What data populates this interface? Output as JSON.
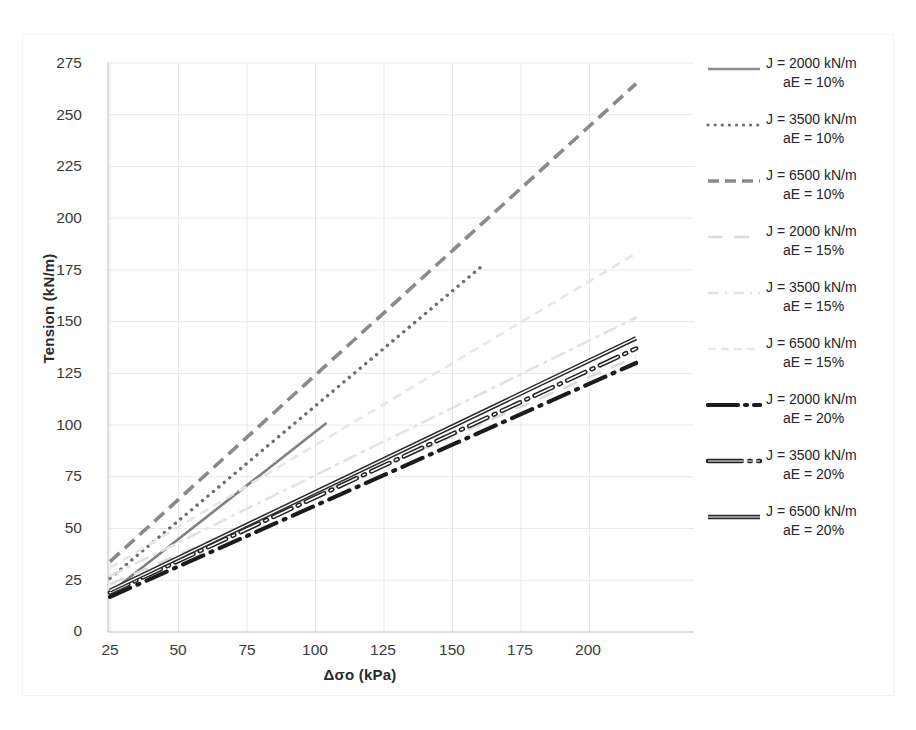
{
  "chart_data": {
    "type": "line",
    "title": "",
    "xlabel": "Δσo (kPa)",
    "ylabel": "Tension (kN/m)",
    "xlim": [
      25,
      218
    ],
    "ylim": [
      0,
      275
    ],
    "xticks": [
      25,
      50,
      75,
      100,
      125,
      150,
      175,
      200
    ],
    "yticks": [
      0,
      25,
      50,
      75,
      100,
      125,
      150,
      175,
      200,
      225,
      250,
      275
    ],
    "grid": true,
    "legend_position": "right",
    "series": [
      {
        "name": "J = 2000 kN/m aE = 10%",
        "J": 2000,
        "aE": "10%",
        "style": "solid",
        "color": "#808080",
        "width": 2.6,
        "x": [
          25,
          104
        ],
        "y": [
          19,
          101
        ]
      },
      {
        "name": "J = 3500 kN/m aE = 10%",
        "J": 3500,
        "aE": "10%",
        "style": "dotted",
        "color": "#6f6f6f",
        "width": 3.4,
        "x": [
          25,
          160
        ],
        "y": [
          26,
          176
        ]
      },
      {
        "name": "J = 6500 kN/m aE = 10%",
        "J": 6500,
        "aE": "10%",
        "style": "dashed",
        "color": "#8a8a8a",
        "width": 3.6,
        "x": [
          25,
          217
        ],
        "y": [
          34,
          265
        ]
      },
      {
        "name": "J = 2000 kN/m aE = 15%",
        "J": 2000,
        "aE": "15%",
        "style": "long-dash",
        "color": "#dcdcdc",
        "width": 2.6,
        "x": [
          25,
          217
        ],
        "y": [
          23,
          133
        ]
      },
      {
        "name": "J = 3500 kN/m aE = 15%",
        "J": 3500,
        "aE": "15%",
        "style": "dash-dot",
        "color": "#e2e2e2",
        "width": 2.6,
        "x": [
          25,
          217
        ],
        "y": [
          27,
          152
        ]
      },
      {
        "name": "J = 6500 kN/m aE = 15%",
        "J": 6500,
        "aE": "15%",
        "style": "fine-dash",
        "color": "#e6e6e6",
        "width": 2.6,
        "x": [
          25,
          217
        ],
        "y": [
          31,
          183
        ]
      },
      {
        "name": "J = 2000 kN/m aE = 20%",
        "J": 2000,
        "aE": "20%",
        "style": "dash-dot-heavy",
        "color": "#1c1c1c",
        "width": 4.2,
        "x": [
          25,
          217
        ],
        "y": [
          17,
          130
        ]
      },
      {
        "name": "J = 3500 kN/m aE = 20%",
        "J": 3500,
        "aE": "20%",
        "style": "double-dot",
        "color": "#232323",
        "width": 3.2,
        "x": [
          25,
          217
        ],
        "y": [
          19,
          137
        ]
      },
      {
        "name": "J = 6500 kN/m aE = 20%",
        "J": 6500,
        "aE": "20%",
        "style": "double-solid",
        "color": "#2a2a2a",
        "width": 3.0,
        "x": [
          25,
          217
        ],
        "y": [
          20,
          142
        ]
      }
    ]
  },
  "axes": {
    "y_title": "Tension (kN/m)",
    "x_title": "Δσo (kPa)",
    "y_ticks": [
      "275",
      "250",
      "225",
      "200",
      "175",
      "150",
      "125",
      "100",
      "75",
      "50",
      "25",
      "0"
    ],
    "x_ticks": [
      "25",
      "50",
      "75",
      "100",
      "125",
      "150",
      "175",
      "200"
    ]
  },
  "legend": {
    "items": [
      {
        "line1": "J = 2000 kN/m",
        "line2": "aE = 10%",
        "swatch": "solid-gray"
      },
      {
        "line1": "J = 3500 kN/m",
        "line2": "aE = 10%",
        "swatch": "dotted-gray"
      },
      {
        "line1": "J = 6500 kN/m",
        "line2": "aE = 10%",
        "swatch": "dashed-gray"
      },
      {
        "line1": "J = 2000 kN/m",
        "line2": "aE = 15%",
        "swatch": "longdash-faint"
      },
      {
        "line1": "J = 3500 kN/m",
        "line2": "aE = 15%",
        "swatch": "dashdot-faint"
      },
      {
        "line1": "J = 6500 kN/m",
        "line2": "aE = 15%",
        "swatch": "finedash-faint"
      },
      {
        "line1": "J = 2000 kN/m",
        "line2": "aE = 20%",
        "swatch": "dashdot-heavy-black"
      },
      {
        "line1": "J = 3500 kN/m",
        "line2": "aE = 20%",
        "swatch": "doubledot-black"
      },
      {
        "line1": "J = 6500 kN/m",
        "line2": "aE = 20%",
        "swatch": "doublesolid-black"
      }
    ]
  }
}
